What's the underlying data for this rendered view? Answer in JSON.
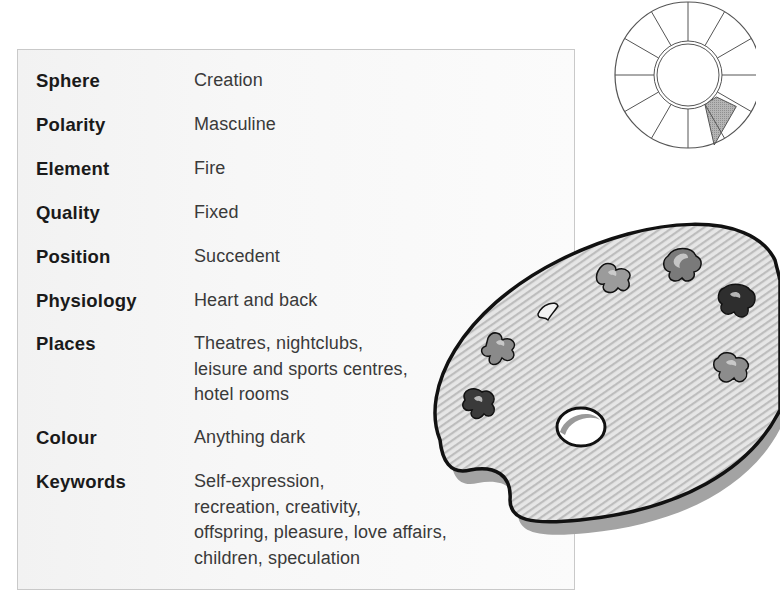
{
  "properties": [
    {
      "label": "Sphere",
      "lines": [
        "Creation"
      ]
    },
    {
      "label": "Polarity",
      "lines": [
        "Masculine"
      ]
    },
    {
      "label": "Element",
      "lines": [
        "Fire"
      ]
    },
    {
      "label": "Quality",
      "lines": [
        "Fixed"
      ]
    },
    {
      "label": "Position",
      "lines": [
        "Succedent"
      ]
    },
    {
      "label": "Physiology",
      "lines": [
        "Heart and back"
      ]
    },
    {
      "label": "Places",
      "lines": [
        "Theatres, nightclubs,",
        "leisure and sports centres,",
        "hotel rooms"
      ]
    },
    {
      "label": "Colour",
      "lines": [
        "Anything dark"
      ]
    },
    {
      "label": "Keywords",
      "lines": [
        "Self-expression,",
        "recreation, creativity,",
        "offspring, pleasure, love affairs,",
        "children, speculation"
      ]
    }
  ],
  "house_wheel": {
    "segments": 12,
    "highlighted_segment": 5,
    "highlight_color": "#a8a8a8"
  },
  "illustration": {
    "subject": "artist-palette",
    "colors": {
      "palette_fill": "#d9d9d9",
      "outline": "#111111",
      "shadow": "#9a9a9a"
    }
  }
}
